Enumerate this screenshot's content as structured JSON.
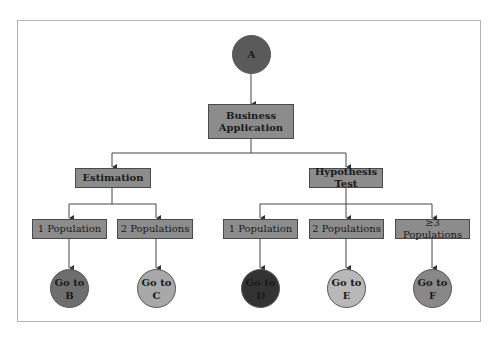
{
  "diagram": {
    "root": {
      "label": "A",
      "color": "#5a5a5a"
    },
    "level1": {
      "label_line1": "Business",
      "label_line2": "Application"
    },
    "level2": [
      {
        "label": "Estimation"
      },
      {
        "label": "Hypothesis Test"
      }
    ],
    "level3": [
      {
        "label": "1 Population",
        "parent": "Estimation"
      },
      {
        "label": "2 Populations",
        "parent": "Estimation"
      },
      {
        "label": "1 Population",
        "parent": "Hypothesis Test"
      },
      {
        "label": "2 Populations",
        "parent": "Hypothesis Test"
      },
      {
        "label": "≥3 Populations",
        "parent": "Hypothesis Test"
      }
    ],
    "leaves": [
      {
        "line1": "Go to",
        "line2": "B",
        "color": "#6e6e6e"
      },
      {
        "line1": "Go to",
        "line2": "C",
        "color": "#a8a8a8"
      },
      {
        "line1": "Go to",
        "line2": "D",
        "color": "#333333"
      },
      {
        "line1": "Go to",
        "line2": "E",
        "color": "#b8b8b8"
      },
      {
        "line1": "Go to",
        "line2": "F",
        "color": "#888888"
      }
    ],
    "colors": {
      "box_fill": "#8c8c8c",
      "line": "#3c3c3c",
      "frame": "#b4b4b4"
    }
  }
}
